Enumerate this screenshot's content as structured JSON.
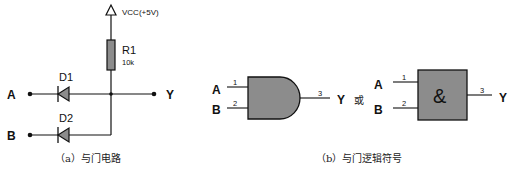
{
  "circuit": {
    "vcc_label": "VCC(+5V)",
    "resistor": {
      "name": "R1",
      "value": "10k"
    },
    "diodes": [
      {
        "name": "D1"
      },
      {
        "name": "D2"
      }
    ],
    "input_a": "A",
    "input_b": "B",
    "output_y": "Y",
    "caption": "（a）与门电路"
  },
  "symbols": {
    "gate1": {
      "input_a": "A",
      "input_b": "B",
      "output": "Y",
      "pin1": "1",
      "pin2": "2",
      "pin3": "3"
    },
    "or_word": "或",
    "gate2": {
      "input_a": "A",
      "input_b": "B",
      "output": "Y",
      "pin1": "1",
      "pin2": "2",
      "pin3": "3",
      "symbol": "&"
    },
    "caption": "（b）与门逻辑符号"
  },
  "colors": {
    "line": "#111111",
    "fill": "#8c8c8c",
    "background": "#ffffff"
  }
}
